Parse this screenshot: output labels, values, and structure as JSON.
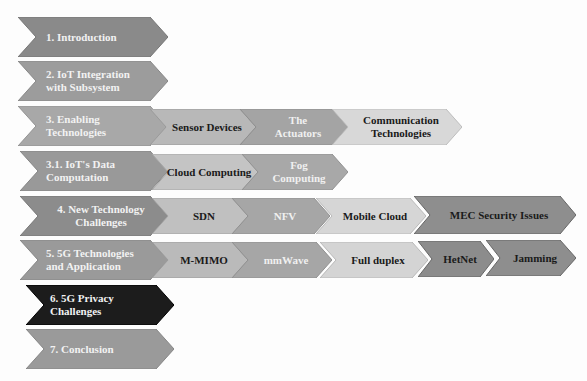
{
  "diagram": {
    "sections": [
      {
        "label": "1. Introduction",
        "fill": "#8a8a8a",
        "subs": []
      },
      {
        "label": "2. IoT Integration with Subsystem",
        "fill": "#9c9c9c",
        "subs": []
      },
      {
        "label": "3. Enabling Technologies",
        "fill": "#a8a8a8",
        "subs": [
          {
            "label": "Sensor Devices",
            "fill": "#b8b8b8",
            "text": "dark"
          },
          {
            "label": "The Actuators",
            "fill": "#a4a4a4",
            "text": "light"
          },
          {
            "label": "Communication Technologies",
            "fill": "#d8d8d8",
            "text": "dark"
          }
        ]
      },
      {
        "label": "3.1. IoT's Data Computation",
        "fill": "#999999",
        "subs": [
          {
            "label": "Cloud Computing",
            "fill": "#c4c4c4",
            "text": "dark"
          },
          {
            "label": "Fog Computing",
            "fill": "#a8a8a8",
            "text": "light"
          }
        ]
      },
      {
        "label": "4. New Technology Challenges",
        "fill": "#8c8c8c",
        "subs": [
          {
            "label": "SDN",
            "fill": "#c0c0c0",
            "text": "dark"
          },
          {
            "label": "NFV",
            "fill": "#a6a6a6",
            "text": "light"
          },
          {
            "label": "Mobile Cloud",
            "fill": "#d6d6d6",
            "text": "dark"
          },
          {
            "label": "MEC Security Issues",
            "fill": "#8e8e8e",
            "text": "dark"
          }
        ]
      },
      {
        "label": "5. 5G Technologies and Application",
        "fill": "#9a9a9a",
        "subs": [
          {
            "label": "M-MIMO",
            "fill": "#bababa",
            "text": "dark"
          },
          {
            "label": "mmWave",
            "fill": "#a6a6a6",
            "text": "light"
          },
          {
            "label": "Full duplex",
            "fill": "#d4d4d4",
            "text": "dark"
          },
          {
            "label": "HetNet",
            "fill": "#8c8c8c",
            "text": "dark"
          },
          {
            "label": "Jamming",
            "fill": "#8e8e8e",
            "text": "dark"
          }
        ]
      },
      {
        "label": "6. 5G Privacy Challenges",
        "fill": "#1c1c1c",
        "subs": []
      },
      {
        "label": "7. Conclusion",
        "fill": "#9a9a9a",
        "subs": []
      }
    ]
  }
}
